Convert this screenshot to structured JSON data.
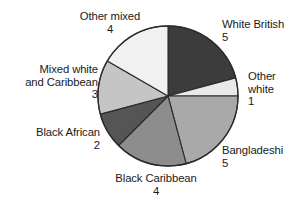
{
  "chart_data": {
    "type": "pie",
    "title": "",
    "subtitle": "",
    "xlabel": "",
    "ylabel": "",
    "grid": false,
    "legend_position": "none",
    "label_style": "outside-callout-text",
    "total": 24,
    "units_per_degree": 15,
    "start_angle_deg": 0,
    "direction": "clockwise",
    "categories": [
      "White British",
      "Other white",
      "Bangladeshi",
      "Black Caribbean",
      "Black African",
      "Mixed white and Caribbean",
      "Other mixed"
    ],
    "values": [
      5,
      1,
      5,
      4,
      2,
      3,
      4
    ],
    "slices": [
      {
        "label": "White British",
        "label_lines": [
          "White British"
        ],
        "value": 5,
        "value_text": "5",
        "sweep_deg": 75,
        "start_deg": 0,
        "end_deg": 75,
        "color": "#3c3c3c"
      },
      {
        "label": "Other white",
        "label_lines": [
          "Other",
          "white"
        ],
        "value": 1,
        "value_text": "1",
        "sweep_deg": 15,
        "start_deg": 75,
        "end_deg": 90,
        "color": "#e9e9e9"
      },
      {
        "label": "Bangladeshi",
        "label_lines": [
          "Bangladeshi"
        ],
        "value": 5,
        "value_text": "5",
        "sweep_deg": 75,
        "start_deg": 90,
        "end_deg": 165,
        "color": "#a9a9a9"
      },
      {
        "label": "Black Caribbean",
        "label_lines": [
          "Black Caribbean"
        ],
        "value": 4,
        "value_text": "4",
        "sweep_deg": 60,
        "start_deg": 165,
        "end_deg": 225,
        "color": "#8d8d8d"
      },
      {
        "label": "Black African",
        "label_lines": [
          "Black African"
        ],
        "value": 2,
        "value_text": "2",
        "sweep_deg": 30,
        "start_deg": 225,
        "end_deg": 255,
        "color": "#555555"
      },
      {
        "label": "Mixed white and Caribbean",
        "label_lines": [
          "Mixed white",
          "and Caribbean"
        ],
        "value": 3,
        "value_text": "3",
        "sweep_deg": 45,
        "start_deg": 255,
        "end_deg": 300,
        "color": "#c5c5c5"
      },
      {
        "label": "Other mixed",
        "label_lines": [
          "Other mixed"
        ],
        "value": 4,
        "value_text": "4",
        "sweep_deg": 60,
        "start_deg": 300,
        "end_deg": 360,
        "color": "#f1f1f1"
      }
    ],
    "colors": {
      "white_british": "#3c3c3c",
      "other_white": "#e9e9e9",
      "bangladeshi": "#a9a9a9",
      "black_caribbean": "#8d8d8d",
      "black_african": "#555555",
      "mixed_white_and_caribbean": "#c5c5c5",
      "other_mixed": "#f1f1f1",
      "outline": "#2b2b2b",
      "background": "#ffffff",
      "text": "#1a1a1a"
    }
  },
  "labels": {
    "white_british": {
      "line1": "White British",
      "value": "5"
    },
    "other_white": {
      "line1": "Other",
      "line2": "white",
      "value": "1"
    },
    "bangladeshi": {
      "line1": "Bangladeshi",
      "value": "5"
    },
    "black_caribbean": {
      "line1": "Black Caribbean",
      "value": "4"
    },
    "black_african": {
      "line1": "Black African",
      "value": "2"
    },
    "mixed_white_and_caribbean": {
      "line1": "Mixed white",
      "line2": "and Caribbean",
      "value": "3"
    },
    "other_mixed": {
      "line1": "Other mixed",
      "value": "4"
    }
  }
}
